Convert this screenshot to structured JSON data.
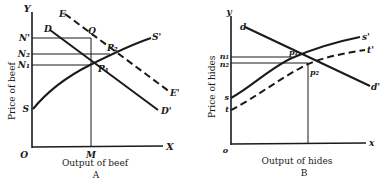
{
  "panelA": {
    "caption": "A",
    "xlabel": "Output of beef",
    "ylabel": "Price of beef",
    "axis": {
      "y": "Y",
      "x": "X",
      "origin": "O"
    },
    "levels": {
      "n_prime": "N'",
      "n2": "N₂",
      "n1": "N₁"
    },
    "m_label": "M",
    "curves": {
      "d_start": "D",
      "d_end": "D'",
      "e_start": "E",
      "e_end": "E'",
      "s_start": "S",
      "s_end": "S'"
    },
    "points": {
      "q": "Q",
      "p1": "P₁",
      "p2": "P₂"
    }
  },
  "panelB": {
    "caption": "B",
    "xlabel": "Output of hides",
    "ylabel": "Price of hides",
    "axis": {
      "y": "y",
      "x": "x",
      "origin": "o"
    },
    "levels": {
      "n1": "n₁",
      "n2": "n₂"
    },
    "curves": {
      "d_start": "d",
      "d_end": "d'",
      "s_start": "s",
      "s_end": "s'",
      "t_start": "t",
      "t_end": "t'"
    },
    "points": {
      "p1": "p₁",
      "p2": "p₂"
    }
  }
}
